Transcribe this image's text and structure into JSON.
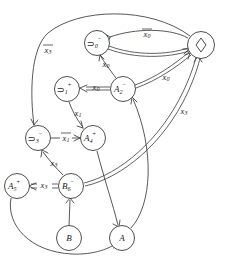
{
  "diagram": {
    "type": "directed-graph",
    "width": 225,
    "height": 264,
    "background_color": "#ffffff",
    "stroke_color": "#3a3a3a",
    "text_color": "#222222"
  },
  "nodes": [
    {
      "id": "n0",
      "name": "node-not0-minus",
      "op": "⊃",
      "sub": "0",
      "sup": "−",
      "label": "⊃0⁻",
      "cx": 97,
      "cy": 43,
      "r": 12.5,
      "shape": "circle"
    },
    {
      "id": "nD",
      "name": "node-diamond",
      "op": "◇",
      "sub": "",
      "sup": "",
      "label": "◇",
      "cx": 201,
      "cy": 45,
      "r": 13.5,
      "shape": "circle"
    },
    {
      "id": "n1",
      "name": "node-not1-plus",
      "op": "⊃",
      "sub": "1",
      "sup": "+",
      "label": "⊃1⁺",
      "cx": 67,
      "cy": 89,
      "r": 12.5,
      "shape": "circle"
    },
    {
      "id": "nA2",
      "name": "node-A2-minus",
      "op": "A",
      "sub": "2",
      "sup": "−",
      "label": "A2⁻",
      "cx": 123,
      "cy": 89,
      "r": 12.5,
      "shape": "circle"
    },
    {
      "id": "n3",
      "name": "node-not3-minus",
      "op": "⊃",
      "sub": "3",
      "sup": "−",
      "label": "⊃3⁻",
      "cx": 38,
      "cy": 138,
      "r": 12.5,
      "shape": "circle"
    },
    {
      "id": "nA4",
      "name": "node-A4-plus",
      "op": "A",
      "sub": "4",
      "sup": "+",
      "label": "A4⁺",
      "cx": 93,
      "cy": 138,
      "r": 12.5,
      "shape": "circle"
    },
    {
      "id": "nA5",
      "name": "node-A5-plus",
      "op": "A",
      "sub": "5",
      "sup": "+",
      "label": "A5⁺",
      "cx": 17,
      "cy": 186,
      "r": 12.5,
      "shape": "circle"
    },
    {
      "id": "nB6",
      "name": "node-B6-minus",
      "op": "B",
      "sub": "6",
      "sup": "−",
      "label": "B6⁻",
      "cx": 71,
      "cy": 186,
      "r": 12.5,
      "shape": "circle"
    },
    {
      "id": "nB",
      "name": "node-B",
      "op": "B",
      "sub": "",
      "sup": "",
      "label": "B",
      "cx": 69,
      "cy": 238,
      "r": 12.5,
      "shape": "circle"
    },
    {
      "id": "nA",
      "name": "node-A",
      "op": "A",
      "sub": "",
      "sup": "",
      "label": "A",
      "cx": 122,
      "cy": 238,
      "r": 12.5,
      "shape": "circle"
    }
  ],
  "edge_labels": [
    {
      "id": "l-x0bar",
      "name": "edge-label-x0-bar",
      "base": "x",
      "sub": "0",
      "overbar": true,
      "x": 147,
      "y": 35
    },
    {
      "id": "l-x3bar",
      "name": "edge-label-x3-bar",
      "base": "x",
      "sub": "3",
      "overbar": true,
      "x": 48,
      "y": 51
    },
    {
      "id": "l-x0a",
      "name": "edge-label-x0-top",
      "base": "x",
      "sub": "0",
      "overbar": false,
      "x": 106,
      "y": 64
    },
    {
      "id": "l-x0b",
      "name": "edge-label-x0-right",
      "base": "x",
      "sub": "0",
      "overbar": false,
      "x": 166,
      "y": 78
    },
    {
      "id": "l-x0c",
      "name": "edge-label-x0-mid",
      "base": "x",
      "sub": "0",
      "overbar": false,
      "x": 95,
      "y": 89
    },
    {
      "id": "l-x1",
      "name": "edge-label-x1",
      "base": "x",
      "sub": "1",
      "overbar": false,
      "x": 78,
      "y": 113
    },
    {
      "id": "l-x1bar",
      "name": "edge-label-x1-bar",
      "base": "x",
      "sub": "1",
      "overbar": true,
      "x": 66,
      "y": 138
    },
    {
      "id": "l-x3a",
      "name": "edge-label-x3-right",
      "base": "x",
      "sub": "3",
      "overbar": false,
      "x": 184,
      "y": 112
    },
    {
      "id": "l-x3b",
      "name": "edge-label-x3-mid",
      "base": "x",
      "sub": "3",
      "overbar": false,
      "x": 54,
      "y": 163
    },
    {
      "id": "l-x3c",
      "name": "edge-label-x3-left",
      "base": "x",
      "sub": "3",
      "overbar": false,
      "x": 44,
      "y": 186
    }
  ],
  "edges": [
    {
      "name": "edge-diamond-to-not0",
      "from": "nD",
      "to": "n0",
      "style": "single",
      "label": "l-x0bar"
    },
    {
      "name": "edge-not0-to-diamond",
      "from": "n0",
      "to": "nD",
      "style": "double",
      "label": ""
    },
    {
      "name": "edge-diamond-to-not3",
      "from": "nD",
      "to": "n3",
      "style": "single",
      "label": "l-x3bar"
    },
    {
      "name": "edge-A2-to-not0",
      "from": "nA2",
      "to": "n0",
      "style": "single",
      "label": "l-x0a"
    },
    {
      "name": "edge-A2-to-diamond",
      "from": "nA2",
      "to": "nD",
      "style": "double",
      "label": "l-x0b"
    },
    {
      "name": "edge-A2-to-not1",
      "from": "nA2",
      "to": "n1",
      "style": "double",
      "label": "l-x0c"
    },
    {
      "name": "edge-not1-to-A4",
      "from": "n1",
      "to": "nA4",
      "style": "single",
      "label": "l-x1"
    },
    {
      "name": "edge-A4-to-not3",
      "from": "nA4",
      "to": "n3",
      "style": "single",
      "label": "l-x1bar"
    },
    {
      "name": "edge-B6-to-not3",
      "from": "nB6",
      "to": "n3",
      "style": "single",
      "label": "l-x3b"
    },
    {
      "name": "edge-B6-to-A5",
      "from": "nB6",
      "to": "nA5",
      "style": "double",
      "label": "l-x3c"
    },
    {
      "name": "edge-B6-to-diamond",
      "from": "nB6",
      "to": "nD",
      "style": "double",
      "label": "l-x3a"
    },
    {
      "name": "edge-B-to-B6",
      "from": "nB",
      "to": "nB6",
      "style": "single",
      "label": ""
    },
    {
      "name": "edge-A-to-A2",
      "from": "nA",
      "to": "nA2",
      "style": "single",
      "label": ""
    },
    {
      "name": "edge-A4-to-A",
      "from": "nA4",
      "to": "nA",
      "style": "single",
      "label": ""
    },
    {
      "name": "edge-A5-to-A",
      "from": "nA5",
      "to": "nA",
      "style": "single",
      "label": ""
    }
  ]
}
